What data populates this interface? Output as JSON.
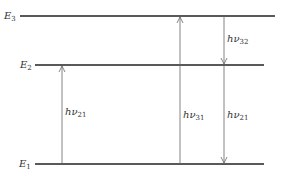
{
  "diagram": {
    "title": "",
    "levels": [
      {
        "id": "E3",
        "label": "E",
        "subscript": "3"
      },
      {
        "id": "E2",
        "label": "E",
        "subscript": "2"
      },
      {
        "id": "E1",
        "label": "E",
        "subscript": "1"
      }
    ],
    "transitions": [
      {
        "id": "t21-up",
        "label": "hν",
        "subscript": "21",
        "direction": "up",
        "from": "E1",
        "to": "E2"
      },
      {
        "id": "t31-up",
        "label": "hν",
        "subscript": "31",
        "direction": "up",
        "from": "E1",
        "to": "E3"
      },
      {
        "id": "t32-down",
        "label": "hν",
        "subscript": "32",
        "direction": "down",
        "from": "E3",
        "to": "E2"
      },
      {
        "id": "t21-down",
        "label": "hν",
        "subscript": "21",
        "direction": "down",
        "from": "E2",
        "to": "E1"
      }
    ],
    "colors": {
      "line": "#222222",
      "arrow": "#666666",
      "text": "#333333"
    }
  }
}
